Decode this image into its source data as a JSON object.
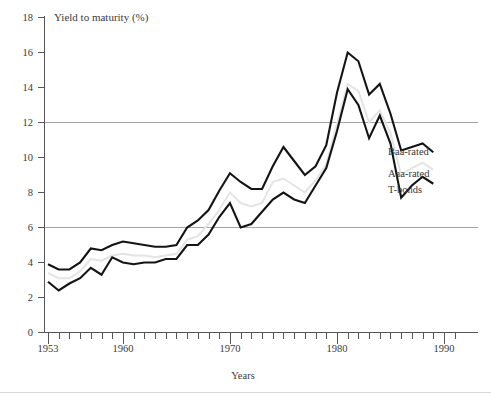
{
  "chart_data": {
    "type": "line",
    "title": "",
    "ylabel": "Yield to maturity (%)",
    "xlabel": "Years",
    "ylim": [
      0,
      18
    ],
    "xlim": [
      1953,
      1991
    ],
    "ytick_labels": [
      "0",
      "2",
      "4",
      "6",
      "8",
      "10",
      "12",
      "14",
      "16",
      "18"
    ],
    "yticks": [
      0,
      2,
      4,
      6,
      8,
      10,
      12,
      14,
      16,
      18
    ],
    "xtick_labels": [
      "1953",
      "1960",
      "1970",
      "1980",
      "1990"
    ],
    "xticks": [
      1953,
      1960,
      1970,
      1980,
      1990
    ],
    "gridlines": [
      6,
      12
    ],
    "grid": "horizontal-at-6-and-12",
    "legend_position": "right-inline-at-line-ends",
    "x": [
      1953,
      1954,
      1955,
      1956,
      1957,
      1958,
      1959,
      1960,
      1961,
      1962,
      1963,
      1964,
      1965,
      1966,
      1967,
      1968,
      1969,
      1970,
      1971,
      1972,
      1973,
      1974,
      1975,
      1976,
      1977,
      1978,
      1979,
      1980,
      1981,
      1982,
      1983,
      1984,
      1985,
      1986,
      1987,
      1988,
      1989
    ],
    "series": [
      {
        "name": "Baa-rated",
        "color": "#141414",
        "values": [
          3.9,
          3.6,
          3.6,
          4.0,
          4.8,
          4.7,
          5.0,
          5.2,
          5.1,
          5.0,
          4.9,
          4.9,
          5.0,
          6.0,
          6.4,
          7.0,
          8.1,
          9.1,
          8.6,
          8.2,
          8.2,
          9.5,
          10.6,
          9.8,
          9.0,
          9.5,
          10.7,
          13.7,
          16.0,
          15.5,
          13.6,
          14.2,
          12.5,
          10.4,
          10.6,
          10.8,
          10.3
        ],
        "style": "solid-dark"
      },
      {
        "name": "Aaa-rated",
        "color": "#e4e4e4",
        "values": [
          3.4,
          3.1,
          3.1,
          3.5,
          4.2,
          4.1,
          4.4,
          4.5,
          4.4,
          4.4,
          4.3,
          4.4,
          4.5,
          5.3,
          5.5,
          6.2,
          7.0,
          8.0,
          7.4,
          7.2,
          7.4,
          8.6,
          8.8,
          8.4,
          8.0,
          8.7,
          9.6,
          11.9,
          14.2,
          13.8,
          12.0,
          12.7,
          11.4,
          9.0,
          9.4,
          9.7,
          9.3
        ],
        "style": "solid-light-gray"
      },
      {
        "name": "T-bonds",
        "color": "#141414",
        "values": [
          2.9,
          2.4,
          2.8,
          3.1,
          3.7,
          3.3,
          4.3,
          4.0,
          3.9,
          4.0,
          4.0,
          4.2,
          4.2,
          5.0,
          5.0,
          5.6,
          6.6,
          7.4,
          6.0,
          6.2,
          6.9,
          7.6,
          8.0,
          7.6,
          7.4,
          8.4,
          9.4,
          11.5,
          13.9,
          13.0,
          11.1,
          12.4,
          10.8,
          7.7,
          8.4,
          8.9,
          8.5
        ],
        "style": "solid-dark"
      }
    ]
  },
  "labels": {
    "y_axis_title": "Yield to maturity (%)",
    "x_axis_title": "Years",
    "series_baa": "Baa-rated",
    "series_aaa": "Aaa-rated",
    "series_tbonds": "T-bonds"
  },
  "ytick_text": {
    "t0": "0",
    "t2": "2",
    "t4": "4",
    "t6": "6",
    "t8": "8",
    "t10": "10",
    "t12": "12",
    "t14": "14",
    "t16": "16",
    "t18": "18"
  },
  "xtick_text": {
    "x1953": "1953",
    "x1960": "1960",
    "x1970": "1970",
    "x1980": "1980",
    "x1990": "1990"
  }
}
